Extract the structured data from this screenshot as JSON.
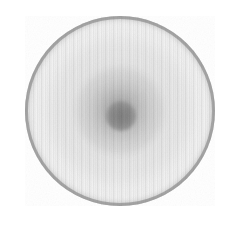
{
  "image": {
    "title": "Radial disc grayscale detector image",
    "colorspace": "grayscale",
    "background_color": "#ffffff",
    "width_px": 245,
    "height_px": 240
  },
  "disc": {
    "center_x_px": 120,
    "center_y_px": 111,
    "diameter_px": 190,
    "radius_px": 95,
    "bounds": {
      "left_px": 25,
      "top_px": 16,
      "right_px": 215,
      "bottom_px": 206
    },
    "rim_color": "#8a8a8a",
    "interior_color": "#f2f2f2",
    "edge_softness_px": 2
  },
  "features": {
    "core": {
      "label": "central dark core",
      "center_x_px": 121,
      "center_y_px": 116,
      "diameter_px": 30,
      "color": "#7c7c7c"
    },
    "inner_halo": {
      "label": "inner halo ring around core",
      "diameter_px": 86,
      "color": "#6e6e6e",
      "peak_opacity": 0.58
    },
    "mid_ring": {
      "label": "broad diffuse mid-radius ring",
      "diameter_px": 150,
      "color": "#787878",
      "peak_opacity": 0.1
    },
    "rim": {
      "label": "dark outer rim annulus",
      "inner_radius_px": 84,
      "outer_radius_px": 95,
      "color": "#8a8a8a"
    }
  },
  "artifacts": {
    "vertical_striping": {
      "label": "vertical column striping artifact",
      "orientation": "vertical",
      "period_px": 4,
      "amplitude": 0.085
    },
    "grain": {
      "label": "sensor grain noise",
      "opacity": 0.5
    }
  },
  "chart_data": {
    "type": "heatmap",
    "xlabel": "radius (px from center)",
    "ylabel": "gray level (0=black, 255=white)",
    "x": [
      0,
      8,
      15,
      22,
      30,
      40,
      50,
      60,
      70,
      80,
      86,
      90,
      93,
      95
    ],
    "values": [
      124,
      130,
      150,
      186,
      216,
      234,
      240,
      242,
      240,
      232,
      208,
      172,
      142,
      138
    ],
    "series": [
      {
        "name": "mean radial gray level",
        "values": [
          124,
          130,
          150,
          186,
          216,
          234,
          240,
          242,
          240,
          232,
          208,
          172,
          142,
          138
        ]
      }
    ],
    "xlim": [
      0,
      95
    ],
    "ylim": [
      0,
      255
    ],
    "grid": false,
    "legend": "none",
    "annotations": [
      "dark core at r=0 (gray ~124)",
      "brightest plateau near r=55-65 (gray ~242)",
      "dark rim annulus at r=88-95 (gray ~138)"
    ]
  }
}
